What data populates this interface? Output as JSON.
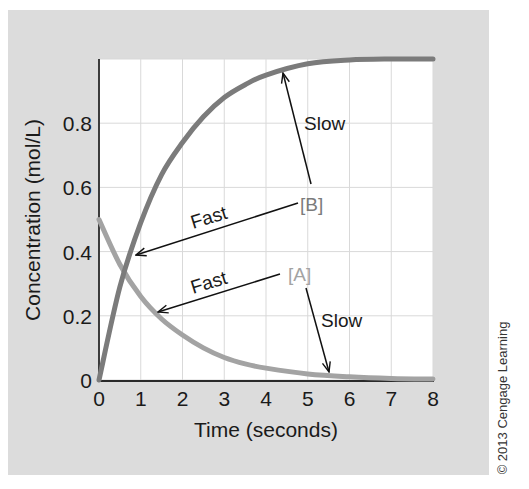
{
  "chart_data": {
    "type": "line",
    "title": "",
    "xlabel": "Time (seconds)",
    "ylabel": "Concentration (mol/L)",
    "xlim": [
      0,
      8
    ],
    "ylim": [
      0,
      1.0
    ],
    "x_ticks": [
      "0",
      "1",
      "2",
      "3",
      "4",
      "5",
      "6",
      "7",
      "8"
    ],
    "y_ticks": [
      "0",
      "0.2",
      "0.4",
      "0.6",
      "0.8"
    ],
    "grid": true,
    "x": [
      0,
      0.5,
      1,
      1.5,
      2,
      2.5,
      3,
      3.5,
      4,
      5,
      6,
      7,
      8
    ],
    "series": [
      {
        "name": "[A]",
        "color": "#a3a3a3",
        "values": [
          0.5,
          0.36,
          0.26,
          0.19,
          0.14,
          0.1,
          0.07,
          0.05,
          0.037,
          0.019,
          0.01,
          0.005,
          0.003
        ]
      },
      {
        "name": "[B]",
        "color": "#7b7b7b",
        "values": [
          0.0,
          0.29,
          0.49,
          0.64,
          0.74,
          0.82,
          0.88,
          0.92,
          0.95,
          0.985,
          0.997,
          1.0,
          1.0
        ]
      }
    ],
    "annotations": [
      {
        "text": "Fast",
        "target": "[B]",
        "note": "arrow from [B] label to steep early part of [B] curve"
      },
      {
        "text": "Slow",
        "target": "[B]",
        "note": "arrow from [B] label up to flattening part of [B] curve"
      },
      {
        "text": "Fast",
        "target": "[A]",
        "note": "arrow from [A] label to steep early part of [A] curve"
      },
      {
        "text": "Slow",
        "target": "[A]",
        "note": "arrow from [A] label down to flattening part of [A] curve"
      }
    ],
    "legend_position": "inline labels"
  },
  "labels": {
    "series_a": "[A]",
    "series_b": "[B]",
    "fast_b": "Fast",
    "slow_b": "Slow",
    "fast_a": "Fast",
    "slow_a": "Slow"
  },
  "copyright": "© 2013 Cengage Learning",
  "colors": {
    "panel_bg": "#dcdcdc",
    "plot_bg": "#ffffff",
    "grid": "#d9d9d9",
    "axis": "#2a2a2a",
    "series_a": "#a3a3a3",
    "series_b": "#7b7b7b",
    "annotation": "#111111"
  }
}
